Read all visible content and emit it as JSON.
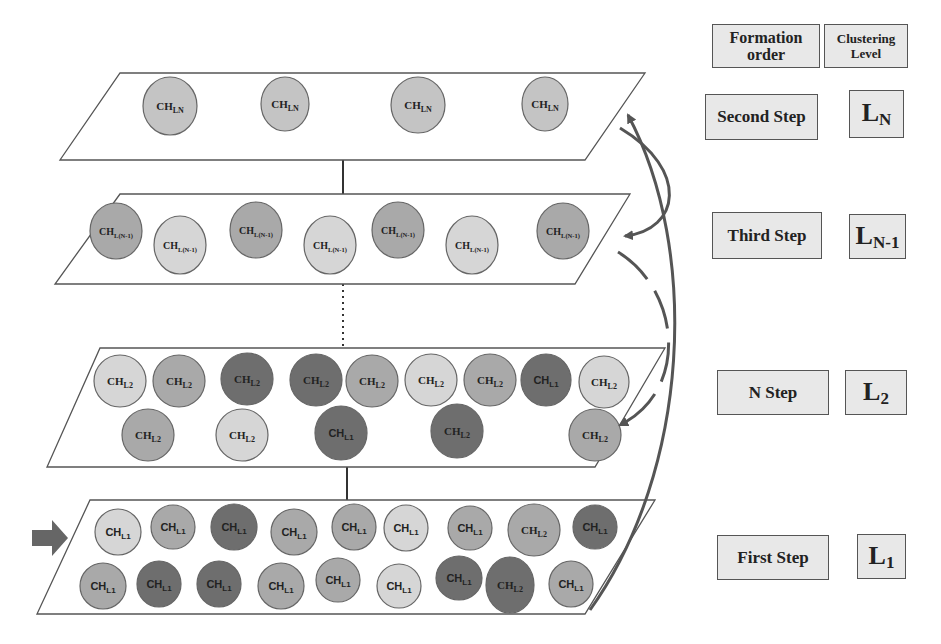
{
  "header": {
    "formation_order": "Formation order",
    "clustering_level": "Clustering Level"
  },
  "rows": [
    {
      "step": "Second Step",
      "level_base": "L",
      "level_sub": "N"
    },
    {
      "step": "Third Step",
      "level_base": "L",
      "level_sub": "N-1"
    },
    {
      "step": "N Step",
      "level_base": "L",
      "level_sub": "2"
    },
    {
      "step": "First Step",
      "level_base": "L",
      "level_sub": "1"
    }
  ],
  "colors": {
    "light": "#d6d6d6",
    "mid": "#a9a9a9",
    "dark": "#6e6e6e",
    "ln": "#c4c4c4",
    "arrow": "#555555",
    "border": "#444444"
  },
  "layers": [
    {
      "name": "layer-LN",
      "poly": [
        [
          120,
          73
        ],
        [
          645,
          73
        ],
        [
          585,
          160
        ],
        [
          60,
          160
        ]
      ],
      "nodes": [
        {
          "x": 170,
          "y": 106,
          "rx": 27,
          "ry": 29,
          "shade": "ln",
          "base": "CH",
          "sub": "LN"
        },
        {
          "x": 285,
          "y": 104,
          "rx": 24,
          "ry": 27,
          "shade": "ln",
          "base": "CH",
          "sub": "LN"
        },
        {
          "x": 418,
          "y": 105,
          "rx": 27,
          "ry": 28,
          "shade": "ln",
          "base": "CH",
          "sub": "LN"
        },
        {
          "x": 545,
          "y": 104,
          "rx": 23,
          "ry": 27,
          "shade": "ln",
          "base": "CH",
          "sub": "LN"
        }
      ]
    },
    {
      "name": "layer-LN-1",
      "poly": [
        [
          120,
          194
        ],
        [
          630,
          194
        ],
        [
          575,
          284
        ],
        [
          55,
          284
        ]
      ],
      "nodes": [
        {
          "x": 116,
          "y": 231,
          "rx": 26,
          "ry": 28,
          "shade": "mid",
          "base": "CH",
          "sub": "L(N-1)"
        },
        {
          "x": 180,
          "y": 245,
          "rx": 26,
          "ry": 29,
          "shade": "light",
          "base": "CH",
          "sub": "L(N-1)"
        },
        {
          "x": 256,
          "y": 230,
          "rx": 26,
          "ry": 28,
          "shade": "mid",
          "base": "CH",
          "sub": "L(N-1)"
        },
        {
          "x": 330,
          "y": 245,
          "rx": 26,
          "ry": 29,
          "shade": "light",
          "base": "CH",
          "sub": "L(N-1)"
        },
        {
          "x": 398,
          "y": 230,
          "rx": 26,
          "ry": 28,
          "shade": "mid",
          "base": "CH",
          "sub": "L(N-1)"
        },
        {
          "x": 472,
          "y": 245,
          "rx": 26,
          "ry": 29,
          "shade": "light",
          "base": "CH",
          "sub": "L(N-1)"
        },
        {
          "x": 563,
          "y": 231,
          "rx": 26,
          "ry": 28,
          "shade": "mid",
          "base": "CH",
          "sub": "L(N-1)"
        }
      ]
    },
    {
      "name": "layer-L2",
      "poly": [
        [
          100,
          348
        ],
        [
          665,
          348
        ],
        [
          595,
          467
        ],
        [
          47,
          467
        ]
      ],
      "nodes": [
        {
          "x": 120,
          "y": 381,
          "rx": 26,
          "ry": 26,
          "shade": "light",
          "base": "CH",
          "sub": "L2"
        },
        {
          "x": 179,
          "y": 381,
          "rx": 26,
          "ry": 26,
          "shade": "mid",
          "base": "CH",
          "sub": "L2"
        },
        {
          "x": 247,
          "y": 379,
          "rx": 26,
          "ry": 26,
          "shade": "dark",
          "base": "CH",
          "sub": "L2"
        },
        {
          "x": 316,
          "y": 380,
          "rx": 26,
          "ry": 26,
          "shade": "dark",
          "base": "CH",
          "sub": "L2"
        },
        {
          "x": 372,
          "y": 381,
          "rx": 26,
          "ry": 26,
          "shade": "mid",
          "base": "CH",
          "sub": "L2"
        },
        {
          "x": 431,
          "y": 380,
          "rx": 26,
          "ry": 26,
          "shade": "light",
          "base": "CH",
          "sub": "L2"
        },
        {
          "x": 490,
          "y": 380,
          "rx": 26,
          "ry": 26,
          "shade": "mid",
          "base": "CH",
          "sub": "L2"
        },
        {
          "x": 546,
          "y": 380,
          "rx": 25,
          "ry": 26,
          "shade": "dark",
          "base": "CH",
          "sub": "L1"
        },
        {
          "x": 604,
          "y": 382,
          "rx": 25,
          "ry": 26,
          "shade": "light",
          "base": "CH",
          "sub": "L2"
        },
        {
          "x": 148,
          "y": 435,
          "rx": 26,
          "ry": 26,
          "shade": "mid",
          "base": "CH",
          "sub": "L2"
        },
        {
          "x": 242,
          "y": 435,
          "rx": 26,
          "ry": 26,
          "shade": "light",
          "base": "CH",
          "sub": "L2"
        },
        {
          "x": 341,
          "y": 433,
          "rx": 26,
          "ry": 27,
          "shade": "dark",
          "base": "CH",
          "sub": "L1"
        },
        {
          "x": 457,
          "y": 431,
          "rx": 26,
          "ry": 27,
          "shade": "dark",
          "base": "CH",
          "sub": "L2"
        },
        {
          "x": 595,
          "y": 435,
          "rx": 26,
          "ry": 26,
          "shade": "mid",
          "base": "CH",
          "sub": "L2"
        }
      ]
    },
    {
      "name": "layer-L1",
      "poly": [
        [
          90,
          500
        ],
        [
          655,
          500
        ],
        [
          585,
          614
        ],
        [
          37,
          614
        ]
      ],
      "nodes": [
        {
          "x": 118,
          "y": 532,
          "rx": 23,
          "ry": 23,
          "shade": "light",
          "base": "CH",
          "sub": "L1"
        },
        {
          "x": 173,
          "y": 527,
          "rx": 22,
          "ry": 22,
          "shade": "mid",
          "base": "CH",
          "sub": "L1"
        },
        {
          "x": 234,
          "y": 527,
          "rx": 23,
          "ry": 23,
          "shade": "dark",
          "base": "CH",
          "sub": "L1"
        },
        {
          "x": 294,
          "y": 532,
          "rx": 23,
          "ry": 23,
          "shade": "mid",
          "base": "CH",
          "sub": "L1"
        },
        {
          "x": 354,
          "y": 527,
          "rx": 22,
          "ry": 23,
          "shade": "mid",
          "base": "CH",
          "sub": "L1"
        },
        {
          "x": 406,
          "y": 528,
          "rx": 22,
          "ry": 23,
          "shade": "light",
          "base": "CH",
          "sub": "L1"
        },
        {
          "x": 470,
          "y": 528,
          "rx": 22,
          "ry": 22,
          "shade": "mid",
          "base": "CH",
          "sub": "L1"
        },
        {
          "x": 534,
          "y": 530,
          "rx": 26,
          "ry": 26,
          "shade": "mid",
          "base": "CH",
          "sub": "L2"
        },
        {
          "x": 595,
          "y": 527,
          "rx": 22,
          "ry": 22,
          "shade": "dark",
          "base": "CH",
          "sub": "L1"
        },
        {
          "x": 103,
          "y": 586,
          "rx": 23,
          "ry": 23,
          "shade": "mid",
          "base": "CH",
          "sub": "L1"
        },
        {
          "x": 159,
          "y": 584,
          "rx": 22,
          "ry": 23,
          "shade": "dark",
          "base": "CH",
          "sub": "L1"
        },
        {
          "x": 219,
          "y": 584,
          "rx": 22,
          "ry": 23,
          "shade": "dark",
          "base": "CH",
          "sub": "L1"
        },
        {
          "x": 281,
          "y": 586,
          "rx": 23,
          "ry": 23,
          "shade": "mid",
          "base": "CH",
          "sub": "L1"
        },
        {
          "x": 338,
          "y": 580,
          "rx": 22,
          "ry": 22,
          "shade": "mid",
          "base": "CH",
          "sub": "L1"
        },
        {
          "x": 399,
          "y": 586,
          "rx": 22,
          "ry": 22,
          "shade": "light",
          "base": "CH",
          "sub": "L1"
        },
        {
          "x": 459,
          "y": 578,
          "rx": 23,
          "ry": 22,
          "shade": "dark",
          "base": "CH",
          "sub": "L1"
        },
        {
          "x": 510,
          "y": 585,
          "rx": 24,
          "ry": 28,
          "shade": "dark",
          "base": "CH",
          "sub": "L2"
        },
        {
          "x": 571,
          "y": 584,
          "rx": 22,
          "ry": 23,
          "shade": "mid",
          "base": "CH",
          "sub": "L1"
        }
      ]
    }
  ],
  "connectors": [
    {
      "type": "solid",
      "x": 343,
      "y1": 160,
      "y2": 194
    },
    {
      "type": "dotted",
      "x": 343,
      "y1": 284,
      "y2": 348
    },
    {
      "type": "solid",
      "x": 347,
      "y1": 467,
      "y2": 500
    }
  ],
  "input_arrow": {
    "label": "input-arrow",
    "x": 32,
    "y": 538
  }
}
